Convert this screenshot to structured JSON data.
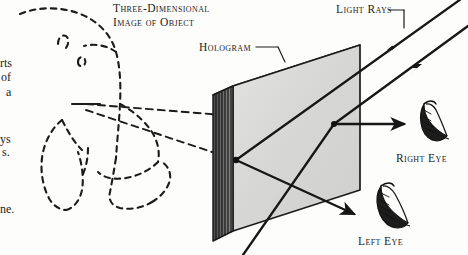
{
  "figure": {
    "background_color": "#fdfdfc",
    "ink_color": "#1a1a1a",
    "plate_face_color": "#d9d9d7",
    "plate_top_color": "#efefee",
    "plate_edge_color": "#3a3a3a"
  },
  "labels": {
    "object_line1": "Three-Dimensional",
    "object_line2": "Image of Object",
    "hologram": "Hologram",
    "light_rays": "Light Rays",
    "right_eye": "Right Eye",
    "left_eye": "Left Eye"
  },
  "edge_fragments": {
    "frag1": "rts",
    "frag2": "of",
    "frag3": "a",
    "frag4": "ys",
    "frag5": "s.",
    "frag6": "ne."
  },
  "elements": {
    "virtual_image": "dashed outline of three-dimensional virtual image",
    "hologram_plate": "hologram recording plate shown in perspective",
    "plate_striations": "vertical interference fringes on plate edge",
    "incoming_rays": "two parallel illuminating light rays entering from upper right",
    "ray_to_right_eye": "diffracted ray travelling to right eye",
    "ray_to_left_eye": "diffracted ray travelling to left eye",
    "virtual_ray_upper": "dashed ray traced back to virtual image",
    "virtual_ray_lower": "dashed ray traced back to virtual image",
    "right_eye_icon": "stylized right eye",
    "left_eye_icon": "stylized left eye"
  }
}
